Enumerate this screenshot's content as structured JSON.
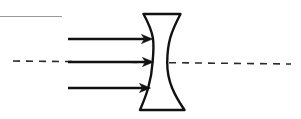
{
  "figure": {
    "title": "Diverging (biconcave) lens with parallel incident rays",
    "type": "optics-ray-diagram",
    "width": 301,
    "height": 119,
    "background_color": "#ffffff",
    "ink_color": "#111111",
    "guide_color": "#9a9a9a"
  },
  "top_guide_line": {
    "name": "top-horizontal-rule",
    "color": "#9a9a9a",
    "x1": 0,
    "y1": 16.5,
    "x2": 62,
    "y2": 16.5,
    "stroke_width": 1.2
  },
  "optical_axis": {
    "name": "optical-axis",
    "style": "dashed",
    "color": "#2a2a2a",
    "x1": 13,
    "y1": 61,
    "x2": 291,
    "y2": 64,
    "stroke_width": 1.6,
    "dash_pattern": "7 6"
  },
  "lens": {
    "name": "biconcave-diverging-lens",
    "color": "#111111",
    "stroke_width": 2.4,
    "fill": "#ffffff",
    "top_edge": {
      "x_left": 143.5,
      "x_right": 180.5,
      "y": 14
    },
    "bottom_edge": {
      "x_left": 140,
      "x_right": 184.5,
      "y": 110
    },
    "waist": {
      "y": 62,
      "x_left": 152.5,
      "x_right": 167
    },
    "left_surface_path": "M 143.5 14 C 154.5 34 154.5 42 152.6 62 C 151.4 82 146 96 140 110",
    "right_surface_path": "M 180.5 14 C 170.5 33 167.5 43 167.2 62 C 167 82 175 96 184.5 110"
  },
  "rays": {
    "name": "incident-parallel-rays",
    "color": "#111111",
    "stroke_width": 2.3,
    "arrowhead_length": 11,
    "arrowhead_half_width": 4.6,
    "items": [
      {
        "label": "upper-ray",
        "x_start": 68,
        "y": 39,
        "x_tip": 152.5
      },
      {
        "label": "central-ray",
        "x_start": 68,
        "y": 62,
        "x_tip": 153.5
      },
      {
        "label": "lower-ray",
        "x_start": 68,
        "y": 88,
        "x_tip": 150.5
      }
    ]
  }
}
